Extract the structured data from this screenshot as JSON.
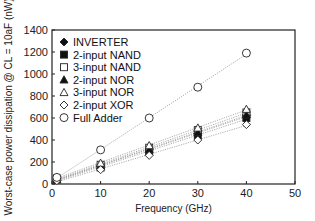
{
  "chart_data": {
    "type": "scatter",
    "title": "",
    "xlabel": "Frequency (GHz)",
    "ylabel": "Worst-case power dissipation @ CL = 10aF (nW)",
    "xlim": [
      0,
      50
    ],
    "ylim": [
      0,
      1400
    ],
    "xticks": [
      0,
      10,
      20,
      30,
      40,
      50
    ],
    "yticks": [
      0,
      200,
      400,
      600,
      800,
      1000,
      1200,
      1400
    ],
    "grid": false,
    "legend_position": "upper-left-inside",
    "trendlines": "dotted linear fit per series",
    "x": [
      1,
      10,
      20,
      30,
      40
    ],
    "series": [
      {
        "name": "INVERTER",
        "marker": "diamond-filled",
        "values": [
          45,
          160,
          310,
          460,
          620
        ]
      },
      {
        "name": "2-input NAND",
        "marker": "square-filled",
        "values": [
          40,
          150,
          290,
          440,
          600
        ]
      },
      {
        "name": "3-input NAND",
        "marker": "square-open",
        "values": [
          50,
          175,
          330,
          490,
          650
        ]
      },
      {
        "name": "2-input NOR",
        "marker": "triangle-filled",
        "values": [
          45,
          165,
          315,
          470,
          630
        ]
      },
      {
        "name": "3-input NOR",
        "marker": "triangle-open",
        "values": [
          60,
          190,
          350,
          510,
          680
        ]
      },
      {
        "name": "2-input XOR",
        "marker": "diamond-open",
        "values": [
          30,
          130,
          260,
          400,
          540
        ]
      },
      {
        "name": "Full Adder",
        "marker": "circle-open",
        "values": [
          60,
          310,
          600,
          880,
          1190
        ]
      }
    ]
  }
}
